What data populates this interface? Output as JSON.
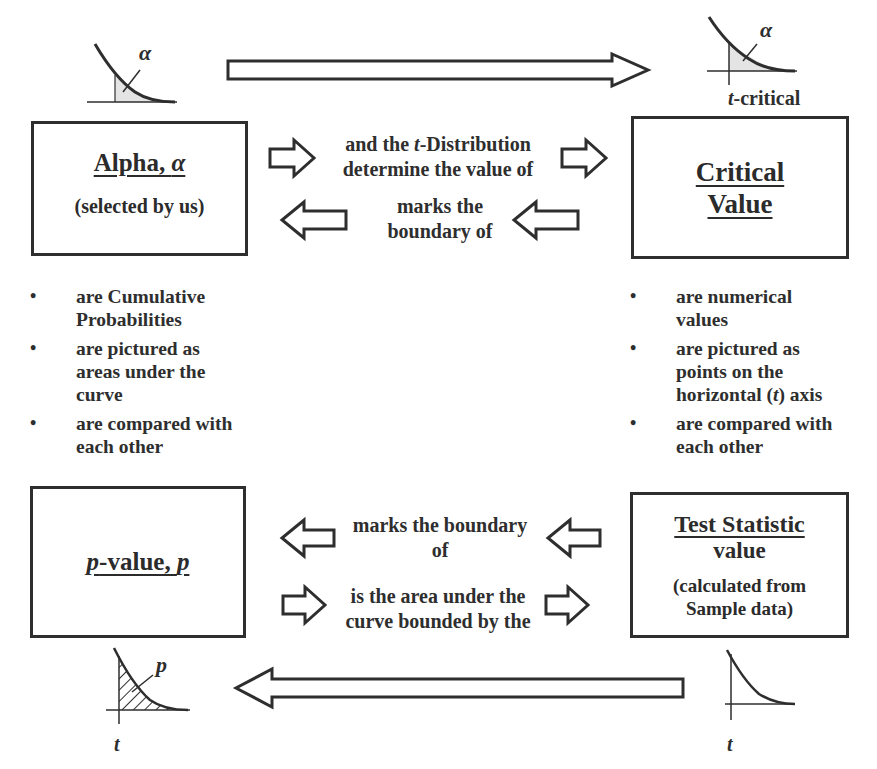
{
  "boxes": {
    "alpha": {
      "title_main": "Alpha, ",
      "title_symbol": "α",
      "subtitle": "(selected by us)"
    },
    "critical": {
      "title_line1": "Critical",
      "title_line2": "Value"
    },
    "pvalue": {
      "title_symbol1": "p",
      "title_main": "-value, ",
      "title_symbol2": "p"
    },
    "test_statistic": {
      "title": "Test Statistic",
      "line2": "value",
      "line3": "(calculated from",
      "line4": "Sample data)"
    }
  },
  "connectors": {
    "top_right": {
      "line1_pre": "and the ",
      "line1_symbol": "t",
      "line1_post": "-Distribution",
      "line2": "determine the value of"
    },
    "top_left": {
      "line1": "marks the",
      "line2": "boundary of"
    },
    "bottom_left": {
      "line1": "marks the boundary",
      "line2": "of"
    },
    "bottom_right": {
      "line1": "is the area under the",
      "line2": "curve bounded by the"
    }
  },
  "bullets": {
    "left": [
      {
        "line1": "are Cumulative",
        "line2": "Probabilities"
      },
      {
        "line1": "are pictured as",
        "line2": "areas under the",
        "line3": "curve"
      },
      {
        "line1": "are compared with",
        "line2": "each other"
      }
    ],
    "right": [
      {
        "line1": "are numerical",
        "line2": "values"
      },
      {
        "line1": "are pictured as",
        "line2": "points on the",
        "line3_pre": "horizontal (",
        "line3_symbol": "t",
        "line3_post": ") axis"
      },
      {
        "line1": "are compared with",
        "line2": "each other"
      }
    ]
  },
  "figures": {
    "top_left_label": "α",
    "top_right_label": "α",
    "top_right_caption_symbol": "t",
    "top_right_caption_text": "-critical",
    "bottom_left_label": "p",
    "bottom_left_axis": "t",
    "bottom_right_axis": "t"
  },
  "icons": [
    "arrow-right-icon",
    "arrow-left-icon",
    "distribution-curve-icon"
  ],
  "colors": {
    "line": "#2e2e2e",
    "shade": "#e4e4e4",
    "background": "#ffffff"
  }
}
